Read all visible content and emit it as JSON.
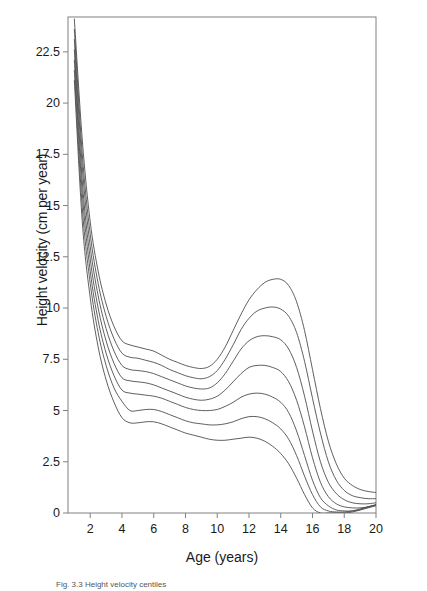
{
  "figure": {
    "background_color": "#ffffff",
    "line_color": "#4d4d4d",
    "axis_color": "#808080"
  },
  "caption": {
    "text": "Fig. 3.3  Height velocity centiles"
  },
  "chart_data": {
    "type": "line",
    "title": "",
    "xlabel": "Age (years)",
    "ylabel": "Height velocity (cm per year)",
    "xlim": [
      0.6,
      20
    ],
    "ylim": [
      0,
      24.2
    ],
    "grid": false,
    "legend": "none",
    "xticks": [
      2,
      4,
      6,
      8,
      10,
      12,
      14,
      16,
      18,
      20
    ],
    "xtick_labels": [
      "2",
      "4",
      "6",
      "8",
      "10",
      "12",
      "14",
      "16",
      "18",
      "20"
    ],
    "yticks": [
      0,
      2.5,
      5,
      7.5,
      10,
      12.5,
      15,
      17.5,
      20,
      22.5
    ],
    "ytick_labels": [
      "0",
      "2.5",
      "5",
      "7.5",
      "10",
      "12.5",
      "15",
      "17.5",
      "20",
      "22.5"
    ],
    "x": [
      1,
      1.5,
      2,
      2.5,
      3,
      3.5,
      4,
      4.5,
      5,
      5.5,
      6,
      6.5,
      7,
      7.5,
      8,
      8.5,
      9,
      9.5,
      10,
      10.5,
      11,
      11.5,
      12,
      12.5,
      13,
      13.5,
      14,
      14.5,
      15,
      15.5,
      16,
      16.5,
      17,
      17.5,
      18,
      18.5,
      19,
      19.5,
      20
    ],
    "series": [
      {
        "name": "97th centile",
        "values": [
          24.1,
          18.2,
          14.2,
          11.8,
          10.2,
          9.1,
          8.4,
          8.2,
          8.1,
          8.0,
          7.9,
          7.7,
          7.5,
          7.35,
          7.2,
          7.1,
          7.05,
          7.15,
          7.5,
          8.1,
          8.9,
          9.7,
          10.4,
          10.9,
          11.25,
          11.4,
          11.4,
          11.1,
          10.3,
          8.9,
          7.0,
          5.1,
          3.5,
          2.4,
          1.7,
          1.35,
          1.15,
          1.05,
          1.0
        ]
      },
      {
        "name": "90th centile",
        "values": [
          23.6,
          17.5,
          13.6,
          11.2,
          9.6,
          8.5,
          7.8,
          7.6,
          7.55,
          7.45,
          7.35,
          7.2,
          7.0,
          6.85,
          6.7,
          6.6,
          6.55,
          6.65,
          6.95,
          7.5,
          8.2,
          8.95,
          9.5,
          9.85,
          10.0,
          10.05,
          9.95,
          9.6,
          8.8,
          7.4,
          5.6,
          3.9,
          2.5,
          1.6,
          1.1,
          0.85,
          0.75,
          0.7,
          0.7
        ]
      },
      {
        "name": "75th centile",
        "values": [
          23.1,
          16.9,
          13.0,
          10.6,
          9.0,
          7.9,
          7.2,
          7.0,
          6.95,
          6.9,
          6.8,
          6.65,
          6.5,
          6.35,
          6.2,
          6.1,
          6.05,
          6.1,
          6.35,
          6.8,
          7.4,
          8.0,
          8.4,
          8.6,
          8.65,
          8.6,
          8.45,
          8.0,
          7.1,
          5.7,
          4.0,
          2.5,
          1.5,
          0.95,
          0.65,
          0.5,
          0.45,
          0.45,
          0.5
        ]
      },
      {
        "name": "50th centile",
        "values": [
          22.6,
          16.2,
          12.4,
          10.0,
          8.4,
          7.3,
          6.6,
          6.45,
          6.4,
          6.35,
          6.25,
          6.1,
          5.95,
          5.8,
          5.65,
          5.55,
          5.5,
          5.55,
          5.7,
          6.0,
          6.4,
          6.8,
          7.1,
          7.2,
          7.2,
          7.1,
          6.9,
          6.4,
          5.5,
          4.2,
          2.7,
          1.5,
          0.8,
          0.45,
          0.3,
          0.25,
          0.25,
          0.3,
          0.4
        ]
      },
      {
        "name": "25th centile",
        "values": [
          22.1,
          15.6,
          11.8,
          9.4,
          7.8,
          6.7,
          6.0,
          5.85,
          5.8,
          5.75,
          5.7,
          5.6,
          5.45,
          5.3,
          5.15,
          5.05,
          5.0,
          5.0,
          5.05,
          5.2,
          5.4,
          5.65,
          5.8,
          5.85,
          5.8,
          5.65,
          5.4,
          4.9,
          4.0,
          2.8,
          1.6,
          0.75,
          0.35,
          0.15,
          0.1,
          0.1,
          0.15,
          0.25,
          0.35
        ]
      },
      {
        "name": "10th centile",
        "values": [
          21.6,
          14.9,
          11.2,
          8.8,
          7.2,
          6.1,
          5.45,
          5.0,
          5.0,
          5.05,
          5.05,
          4.95,
          4.8,
          4.65,
          4.5,
          4.4,
          4.35,
          4.3,
          4.3,
          4.35,
          4.45,
          4.6,
          4.7,
          4.7,
          4.6,
          4.4,
          4.1,
          3.6,
          2.8,
          1.8,
          0.9,
          0.3,
          0.1,
          0.05,
          0.05,
          0.1,
          0.2,
          0.3,
          0.4
        ]
      },
      {
        "name": "3rd centile",
        "values": [
          21.1,
          14.2,
          10.5,
          8.1,
          6.5,
          5.4,
          4.65,
          4.4,
          4.4,
          4.45,
          4.45,
          4.35,
          4.2,
          4.05,
          3.9,
          3.8,
          3.7,
          3.6,
          3.55,
          3.55,
          3.6,
          3.65,
          3.7,
          3.65,
          3.5,
          3.25,
          2.9,
          2.4,
          1.7,
          0.9,
          0.25,
          0.0,
          0.0,
          0.0,
          0.0,
          0.05,
          0.15,
          0.3,
          0.4
        ]
      }
    ]
  }
}
